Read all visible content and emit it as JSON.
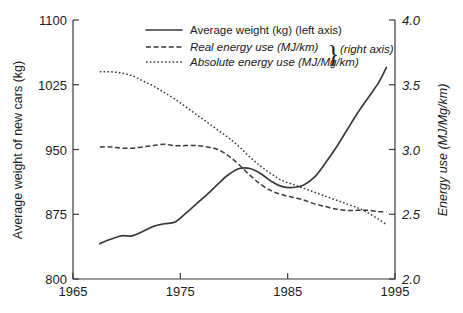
{
  "chart_data": {
    "type": "line",
    "title": "",
    "xlabel": "",
    "ylabel": "Average weight of new cars (kg)",
    "y2label": "Energy use (MJ/Mg/km)",
    "xlim": [
      1965,
      1995
    ],
    "ylim": [
      800,
      1100
    ],
    "y2lim": [
      2.0,
      4.0
    ],
    "grid": false,
    "legend_position": "top-center",
    "xticks": [
      "1965",
      "1975",
      "1985",
      "1995"
    ],
    "xtick_values": [
      1965,
      1975,
      1985,
      1995
    ],
    "yticks": [
      "800",
      "875",
      "950",
      "1025",
      "1100"
    ],
    "ytick_values": [
      800,
      875,
      950,
      1025,
      1100
    ],
    "y2ticks": [
      "2.0",
      "2.5",
      "3.0",
      "3.5",
      "4.0"
    ],
    "y2tick_values": [
      2.0,
      2.5,
      3.0,
      3.5,
      4.0
    ],
    "series": [
      {
        "name": "Average weight (kg) (left axis)",
        "axis": "left",
        "style": "solid",
        "x": [
          1967.5,
          1968.5,
          1969.5,
          1970.5,
          1971.5,
          1972.5,
          1973.5,
          1974.5,
          1975.5,
          1976.5,
          1977.5,
          1978.5,
          1979.5,
          1980.5,
          1981.5,
          1982.5,
          1983.5,
          1984.5,
          1985.5,
          1986.5,
          1987.5,
          1988.5,
          1989.5,
          1990.5,
          1991.5,
          1992.5,
          1993.5,
          1994.2
        ],
        "values": [
          841,
          846,
          850,
          850,
          855,
          861,
          864,
          866,
          876,
          887,
          898,
          910,
          921,
          928,
          928,
          922,
          913,
          907,
          906,
          909,
          918,
          934,
          952,
          972,
          992,
          1010,
          1028,
          1045
        ]
      },
      {
        "name": "Real energy use (MJ/km)",
        "axis": "right",
        "style": "dashed",
        "x": [
          1967.5,
          1968.5,
          1969.5,
          1970.5,
          1971.5,
          1972.5,
          1973.5,
          1974.5,
          1975.5,
          1976.5,
          1977.5,
          1978.5,
          1979.5,
          1980.5,
          1981.5,
          1982.5,
          1983.5,
          1984.5,
          1985.5,
          1986.5,
          1987.5,
          1988.5,
          1989.5,
          1990.5,
          1991.5,
          1992.5,
          1993.5,
          1994.2
        ],
        "values": [
          3.02,
          3.02,
          3.01,
          3.01,
          3.02,
          3.03,
          3.04,
          3.03,
          3.03,
          3.03,
          3.02,
          3.0,
          2.95,
          2.88,
          2.8,
          2.73,
          2.68,
          2.65,
          2.63,
          2.61,
          2.58,
          2.56,
          2.54,
          2.53,
          2.53,
          2.53,
          2.52,
          2.52
        ]
      },
      {
        "name": "Absolute energy use (MJ/Mg/km)",
        "axis": "right",
        "style": "dotted",
        "x": [
          1967.5,
          1968.5,
          1969.5,
          1970.5,
          1971.5,
          1972.5,
          1973.5,
          1974.5,
          1975.5,
          1976.5,
          1977.5,
          1978.5,
          1979.5,
          1980.5,
          1981.5,
          1982.5,
          1983.5,
          1984.5,
          1985.5,
          1986.5,
          1987.5,
          1988.5,
          1989.5,
          1990.5,
          1991.5,
          1992.5,
          1993.5,
          1994.2
        ],
        "values": [
          3.6,
          3.6,
          3.59,
          3.57,
          3.53,
          3.49,
          3.44,
          3.39,
          3.33,
          3.27,
          3.21,
          3.15,
          3.09,
          3.02,
          2.94,
          2.87,
          2.81,
          2.76,
          2.73,
          2.7,
          2.67,
          2.64,
          2.61,
          2.58,
          2.55,
          2.51,
          2.46,
          2.42
        ]
      }
    ]
  },
  "legend": {
    "items": [
      {
        "label": "Average weight (kg) (left axis)",
        "style": "solid",
        "italic": false
      },
      {
        "label": "Real energy use (MJ/km)",
        "style": "dashed",
        "italic": true
      },
      {
        "label": "Absolute energy use (MJ/Mg/km)",
        "style": "dotted",
        "italic": true
      }
    ],
    "brace": "}",
    "brace_label": "(right axis)"
  }
}
